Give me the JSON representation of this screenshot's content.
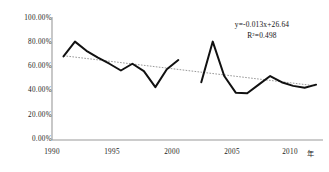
{
  "chart_data": {
    "type": "line",
    "title": "",
    "xlabel": "年",
    "ylabel": "",
    "xlim": [
      1989.0,
      1102.0
    ],
    "ylim": [
      0,
      100
    ],
    "grid": false,
    "legend_position": "none",
    "x_ticks": [
      "1990",
      "1995",
      "2000",
      "2005",
      "2010"
    ],
    "x_tick_values": [
      1990,
      1995,
      2000,
      2005,
      2010
    ],
    "y_ticks": [
      "0.00%",
      "20.00%",
      "40.00%",
      "60.00%",
      "80.00%",
      "100.00%"
    ],
    "y_tick_values": [
      0,
      20,
      40,
      60,
      80,
      100
    ],
    "annotations": [
      "y=-0.013x+26.64",
      "R²=0.498"
    ],
    "trendline": {
      "equation": "y=-0.013x+26.64",
      "r_squared": 0.498,
      "slope": -0.013,
      "intercept": 26.64,
      "style": "dotted",
      "x_start": 1990,
      "x_end": 2012,
      "y_start": 68.5,
      "y_end": 44.0
    },
    "series": [
      {
        "name": "observed",
        "segments": [
          {
            "x": [
              1990,
              1991,
              1992,
              1993,
              1994,
              1995,
              1996,
              1997,
              1998,
              1999,
              2000
            ],
            "values": [
              68.0,
              80.0,
              72.5,
              67.0,
              62.0,
              56.5,
              62.0,
              56.0,
              43.0,
              57.5,
              65.0
            ]
          },
          {
            "x": [
              2002,
              2003,
              2004,
              2005,
              2006,
              2007,
              2008,
              2009,
              2010,
              2011,
              2012
            ],
            "values": [
              47.0,
              80.0,
              52.0,
              38.5,
              38.0,
              45.0,
              52.0,
              47.0,
              44.0,
              42.5,
              45.0
            ]
          }
        ]
      }
    ],
    "colors": {
      "series_line": "#111111",
      "trendline": "#8c8c8c",
      "axis": "#9a9a9a",
      "text": "#1a1a1a",
      "background": "#ffffff"
    }
  }
}
